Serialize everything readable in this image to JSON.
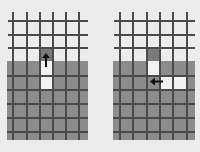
{
  "colors": {
    "background": "#ececec",
    "filled": "#8c8c8c",
    "dark_cell": "#7a7a7a",
    "empty": "#f0f0f0",
    "grid_line": "#4a4a4a",
    "arrow": "#111111"
  },
  "panels": [
    {
      "name": "left-grid",
      "arrow": {
        "direction": "up",
        "glyph": "↑"
      },
      "white_cells": [
        [
          3,
          0
        ],
        [
          3,
          1
        ]
      ],
      "dark_cell": [
        3,
        -1
      ]
    },
    {
      "name": "right-grid",
      "arrow": {
        "direction": "left",
        "glyph": "←"
      },
      "white_cells": [
        [
          3,
          0
        ],
        [
          4,
          1
        ],
        [
          5,
          1
        ]
      ],
      "dark_cell": [
        3,
        -1
      ]
    }
  ]
}
